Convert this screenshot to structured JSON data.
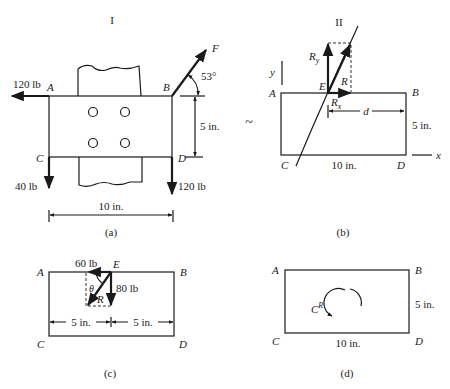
{
  "figure_a": {
    "title": "I",
    "caption": "(a)",
    "corners": {
      "A": "A",
      "B": "B",
      "C": "C",
      "D": "D"
    },
    "forces": {
      "at_A": "120 lb",
      "at_B": "F",
      "at_C": "40 lb",
      "at_D": "120 lb"
    },
    "angle": "53°",
    "height_dim": "5 in.",
    "width_dim": "10 in."
  },
  "figure_b": {
    "title": "II",
    "caption": "(b)",
    "equivalence_symbol": "~",
    "corners": {
      "A": "A",
      "B": "B",
      "C": "C",
      "D": "D"
    },
    "point": "E",
    "resultant": "R",
    "components": {
      "x": "R",
      "x_sub": "x",
      "y": "R",
      "y_sub": "y"
    },
    "axis_x": "x",
    "axis_y": "y",
    "distance": "d",
    "height_dim": "5 in.",
    "width_dim": "10 in."
  },
  "figure_c": {
    "caption": "(c)",
    "corners": {
      "A": "A",
      "B": "B",
      "C": "C",
      "D": "D"
    },
    "point": "E",
    "horizontal_force": "60 lb",
    "vertical_force": "80 lb",
    "resultant": "R",
    "angle": "θ",
    "left_dim": "5 in.",
    "right_dim": "5 in."
  },
  "figure_d": {
    "caption": "(d)",
    "corners": {
      "A": "A",
      "B": "B",
      "C": "C",
      "D": "D"
    },
    "couple": "C",
    "couple_sup": "R",
    "height_dim": "5 in.",
    "width_dim": "10 in."
  }
}
